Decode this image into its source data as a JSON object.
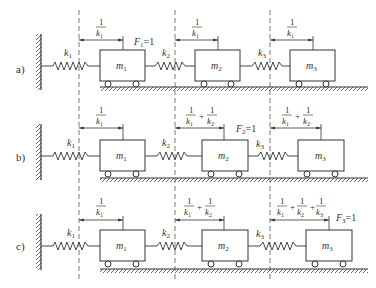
{
  "rows": [
    {
      "label": "a)",
      "masses": [
        "m",
        "m",
        "m"
      ],
      "mass_subs": [
        "1",
        "2",
        "3"
      ],
      "springs": [
        "k",
        "k",
        "k"
      ],
      "spring_subs": [
        "1",
        "2",
        "3"
      ],
      "force": {
        "text": "F",
        "sub": "1",
        "eq": "=1",
        "at_mass": 1
      },
      "displacements": [
        "1/k1",
        "1/k1",
        "1/k1"
      ]
    },
    {
      "label": "b)",
      "masses": [
        "m",
        "m",
        "m"
      ],
      "mass_subs": [
        "1",
        "2",
        "3"
      ],
      "springs": [
        "k",
        "k",
        "k"
      ],
      "spring_subs": [
        "1",
        "2",
        "3"
      ],
      "force": {
        "text": "F",
        "sub": "2",
        "eq": "=1",
        "at_mass": 2
      },
      "displacements": [
        "1/k1",
        "1/k1 + 1/k2",
        "1/k1 + 1/k2"
      ]
    },
    {
      "label": "c)",
      "masses": [
        "m",
        "m",
        "m"
      ],
      "mass_subs": [
        "1",
        "2",
        "3"
      ],
      "springs": [
        "k",
        "k",
        "k"
      ],
      "spring_subs": [
        "1",
        "2",
        "3"
      ],
      "force": {
        "text": "F",
        "sub": "3",
        "eq": "=1",
        "at_mass": 3
      },
      "displacements": [
        "1/k1",
        "1/k1 + 1/k2",
        "1/k1 + 1/k2 + 1/k3"
      ]
    }
  ],
  "frac": {
    "num": "1",
    "den": "k",
    "plus": "+"
  }
}
